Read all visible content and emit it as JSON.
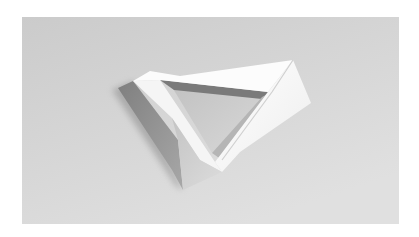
{
  "image": {
    "subject": "folded paper triangle",
    "description": "Photograph of a white folded-paper triangular frame with a triangular opening, resting on a light gray surface",
    "colors": {
      "border": "#ffffff",
      "background_top": "#cbcbcb",
      "background_bottom": "#e0e0e0",
      "paper_light": "#fbfbfb",
      "paper_mid": "#e6e6e6",
      "paper_shade": "#b9b9b9",
      "paper_dark": "#8e8e8e",
      "shadow": "#9a9a9a",
      "hole": "#c9c9c9"
    }
  }
}
